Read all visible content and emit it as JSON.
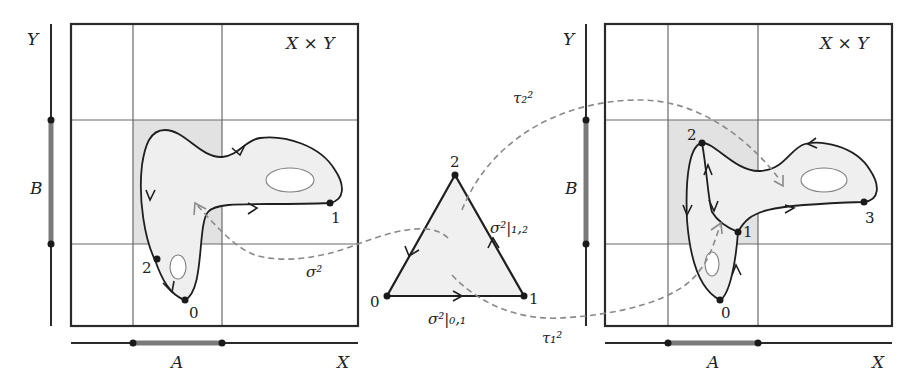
{
  "figure": {
    "left_panel": {
      "product_label": "X × Y",
      "y_axis_label": "Y",
      "x_axis_label": "X",
      "subset_y_label": "B",
      "subset_x_label": "A",
      "vertex_labels": [
        "0",
        "1",
        "2"
      ]
    },
    "simplex": {
      "vertex_labels": [
        "0",
        "1",
        "2"
      ],
      "edge_label_01": "σ²|₀,₁",
      "edge_label_12": "σ²|₁,₂"
    },
    "right_panel": {
      "product_label": "X × Y",
      "y_axis_label": "Y",
      "x_axis_label": "X",
      "subset_y_label": "B",
      "subset_x_label": "A",
      "vertex_labels": [
        "0",
        "1",
        "2",
        "3"
      ]
    },
    "maps": {
      "sigma": "σ²",
      "tau1": "τ₁²",
      "tau2": "τ₂²"
    },
    "colors": {
      "line": "#1f1f1f",
      "dashed": "#8a8a8a",
      "shaded_cell": "#e2e2e2",
      "region_fill": "#efefef"
    }
  }
}
